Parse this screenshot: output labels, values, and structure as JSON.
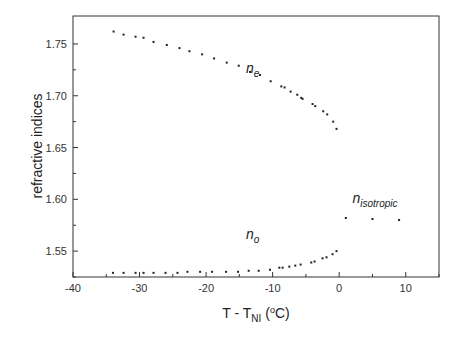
{
  "chart_data": {
    "type": "scatter",
    "title": "",
    "xlabel": "T - T_NI (°C)",
    "xlabel_parts": {
      "main": "T - T",
      "sub": "NI",
      "unit_open": " (",
      "sup": "o",
      "unit_close": "C)"
    },
    "ylabel": "refractive indices",
    "xlim": [
      -40,
      15
    ],
    "ylim": [
      1.525,
      1.777
    ],
    "x_ticks": [
      -40,
      -30,
      -20,
      -10,
      0,
      10
    ],
    "x_tick_labels": [
      "-40",
      "-30",
      "-20",
      "-10",
      "0",
      "10"
    ],
    "y_ticks": [
      1.55,
      1.6,
      1.65,
      1.7,
      1.75
    ],
    "y_tick_labels": [
      "1.55",
      "1.60",
      "1.65",
      "1.70",
      "1.75"
    ],
    "grid": false,
    "legend": "none",
    "annotations": [
      {
        "text": "n",
        "sub": "e",
        "x": -14,
        "y": 1.722
      },
      {
        "text": "n",
        "sub": "o",
        "x": -14,
        "y": 1.562
      },
      {
        "text": "n",
        "sub": "isotropic",
        "x": 2,
        "y": 1.596
      }
    ],
    "series": [
      {
        "name": "n_e",
        "x": [
          -33.9,
          -32.4,
          -30.6,
          -29.4,
          -27.9,
          -25.9,
          -24.0,
          -22.5,
          -20.6,
          -18.8,
          -16.9,
          -15.1,
          -13.4,
          -11.9,
          -10.3,
          -8.7,
          -8.2,
          -7.3,
          -6.3,
          -5.7,
          -5.5,
          -4.0,
          -3.6,
          -2.4,
          -1.8,
          -0.9,
          -0.4
        ],
        "y": [
          1.762,
          1.759,
          1.757,
          1.756,
          1.752,
          1.749,
          1.746,
          1.743,
          1.74,
          1.736,
          1.732,
          1.729,
          1.723,
          1.72,
          1.714,
          1.709,
          1.708,
          1.704,
          1.701,
          1.698,
          1.697,
          1.692,
          1.69,
          1.685,
          1.682,
          1.675,
          1.668
        ]
      },
      {
        "name": "n_o",
        "x": [
          -34.0,
          -32.4,
          -30.6,
          -29.4,
          -27.9,
          -26.1,
          -24.3,
          -22.8,
          -20.9,
          -19.1,
          -17.0,
          -15.2,
          -13.6,
          -12.1,
          -10.4,
          -9.0,
          -8.5,
          -7.5,
          -6.6,
          -5.8,
          -4.2,
          -3.7,
          -2.5,
          -1.9,
          -1.0,
          -0.4
        ],
        "y": [
          1.529,
          1.529,
          1.529,
          1.529,
          1.529,
          1.529,
          1.529,
          1.53,
          1.53,
          1.53,
          1.53,
          1.53,
          1.531,
          1.531,
          1.532,
          1.534,
          1.534,
          1.535,
          1.536,
          1.537,
          1.539,
          1.54,
          1.543,
          1.544,
          1.547,
          1.55
        ]
      },
      {
        "name": "n_isotropic",
        "x": [
          1.0,
          5.0,
          9.0
        ],
        "y": [
          1.582,
          1.581,
          1.58
        ]
      }
    ]
  }
}
